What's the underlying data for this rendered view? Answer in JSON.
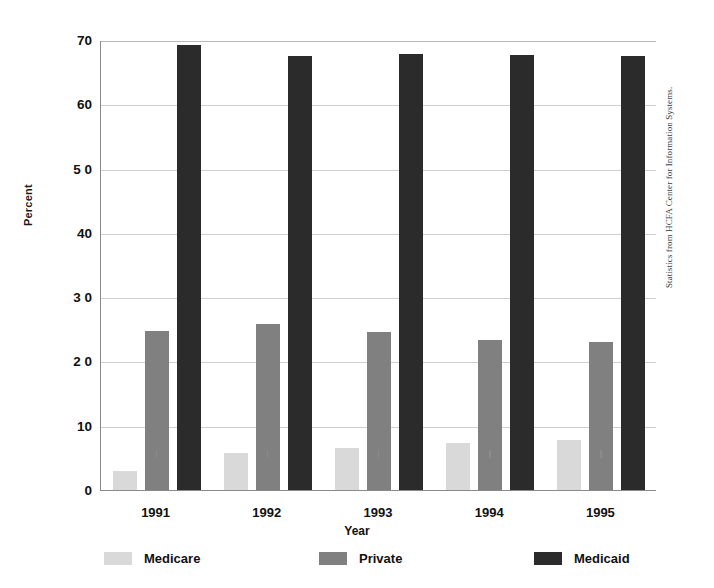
{
  "chart_data": {
    "type": "bar",
    "title": "",
    "xlabel": "Year",
    "ylabel": "Percent",
    "categories": [
      "1991",
      "1992",
      "1993",
      "1994",
      "1995"
    ],
    "series": [
      {
        "name": "Medicare",
        "color": "#d9d9d9",
        "values": [
          3.0,
          5.7,
          6.6,
          7.3,
          7.8
        ]
      },
      {
        "name": "Private",
        "color": "#808080",
        "values": [
          24.8,
          25.8,
          24.6,
          23.3,
          23.0
        ]
      },
      {
        "name": "Medicaid",
        "color": "#2b2b2b",
        "values": [
          69.2,
          67.5,
          67.8,
          67.7,
          67.5
        ]
      }
    ],
    "ylim": [
      0,
      70
    ],
    "yticks": [
      "0",
      "10",
      "2 0",
      "3 0",
      "40",
      "5 0",
      "60",
      "70"
    ],
    "ytick_values": [
      0,
      10,
      20,
      30,
      40,
      50,
      60,
      70
    ],
    "grid": true,
    "legend_position": "bottom"
  },
  "source_note": "Statistics from HCFA Center for Information Systems.",
  "legend": {
    "items": [
      {
        "label": "Medicare",
        "swatch": "medicare"
      },
      {
        "label": "Private",
        "swatch": "private"
      },
      {
        "label": "Medicaid",
        "swatch": "medicaid"
      }
    ]
  }
}
